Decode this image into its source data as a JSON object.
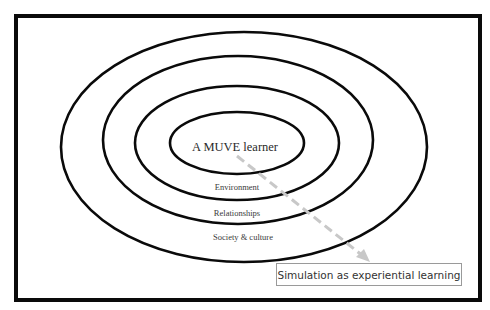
{
  "diagram": {
    "center_label": "A MUVE learner",
    "rings": [
      {
        "label": "Environment"
      },
      {
        "label": "Relationships"
      },
      {
        "label": "Society & culture"
      }
    ],
    "callout_label": "Simulation as experiential learning",
    "colors": {
      "stroke": "#0a0a0a",
      "arrow": "#c8c8c8",
      "callout_border": "#9a9a9a",
      "text": "#333333"
    }
  }
}
